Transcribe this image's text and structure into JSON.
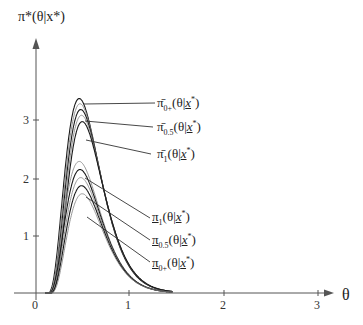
{
  "chart_data": {
    "type": "line",
    "title": "",
    "ylabel": "π*(θ|x*)",
    "xlabel": "θ",
    "xlim": [
      0,
      3
    ],
    "ylim": [
      0,
      3.6
    ],
    "x_ticks": [
      "0",
      "1",
      "2",
      "3"
    ],
    "y_ticks": [
      "1",
      "2",
      "3"
    ],
    "grid": false,
    "legend": "leader-line annotations at right of curves",
    "peak_theta": 0.46,
    "support": [
      0.12,
      1.25
    ],
    "series": [
      {
        "name": "π̄_{0+}(θ|x*)",
        "group": "upper",
        "peak": 3.37
      },
      {
        "name": "upper-intermediate-1",
        "group": "upper",
        "peak": 3.28
      },
      {
        "name": "π̄_{0.5}(θ|x*)",
        "group": "upper",
        "peak": 3.18
      },
      {
        "name": "upper-intermediate-2",
        "group": "upper",
        "peak": 3.08
      },
      {
        "name": "π̄_1(θ|x*)",
        "group": "upper",
        "peak": 2.97
      },
      {
        "name": "π_1(θ|x*)",
        "group": "lower",
        "peak": 2.28
      },
      {
        "name": "lower-intermediate-1",
        "group": "lower",
        "peak": 2.14
      },
      {
        "name": "π_{0.5}(θ|x*)",
        "group": "lower",
        "peak": 2.0
      },
      {
        "name": "lower-intermediate-2",
        "group": "lower",
        "peak": 1.86
      },
      {
        "name": "π_{0+}(θ|x*)",
        "group": "lower",
        "peak": 1.72
      }
    ]
  },
  "labels": {
    "y_axis": "π*(θ|x*)",
    "x_axis": "θ",
    "upper_0plus": {
      "base": "π̄",
      "sub": "0+",
      "arg": "(θ|",
      "x": "x",
      "end": "*)"
    },
    "upper_05": {
      "base": "π̄",
      "sub": "0.5",
      "arg": "(θ|",
      "x": "x",
      "end": "*)"
    },
    "upper_1": {
      "base": "π̄",
      "sub": "1",
      "arg": "(θ|",
      "x": "x",
      "end": "*)"
    },
    "lower_1": {
      "base": "π",
      "sub": "1",
      "arg": "(θ|",
      "x": "x",
      "end": "*)"
    },
    "lower_05": {
      "base": "π",
      "sub": "0.5",
      "arg": "(θ|",
      "x": "x",
      "end": "*)"
    },
    "lower_0plus": {
      "base": "π",
      "sub": "0+",
      "arg": "(θ|",
      "x": "x",
      "end": "*)"
    }
  },
  "ticks": {
    "x0": "0",
    "x1": "1",
    "x2": "2",
    "x3": "3",
    "y1": "1",
    "y2": "2",
    "y3": "3"
  },
  "colors": {
    "axis": "#555555",
    "curve_dark": "#1a1a1a",
    "curve_gray": "#8a8a8a",
    "text": "#222222"
  }
}
